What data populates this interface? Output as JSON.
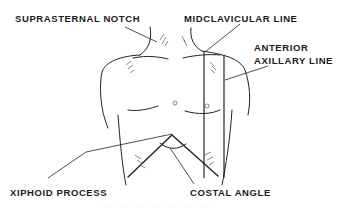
{
  "figure": {
    "labels": {
      "suprasternal_notch": "SUPRASTERNAL NOTCH",
      "midclavicular_line": "MIDCLAVICULAR LINE",
      "anterior_axillary_line_1": "ANTERIOR",
      "anterior_axillary_line_2": "AXILLARY LINE",
      "xiphoid_process": "XIPHOID PROCESS",
      "costal_angle": "COSTAL ANGLE"
    },
    "caption_fragment": ". . . . . . . . .     . . . . . . . . . . . . ."
  }
}
